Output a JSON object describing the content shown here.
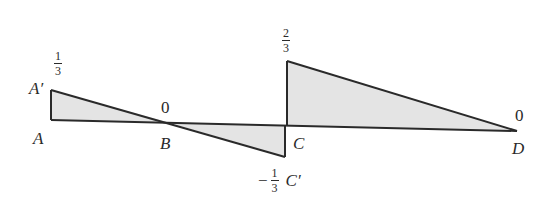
{
  "diagram": {
    "points": {
      "A": {
        "label": "A",
        "x": 51,
        "y": 120
      },
      "A_prime": {
        "label": "A′",
        "x": 51,
        "y": 90
      },
      "B": {
        "label": "B",
        "x": 167,
        "y": 122
      },
      "C": {
        "label": "C",
        "x": 285,
        "y": 126
      },
      "C_prime": {
        "label": "C′",
        "x": 285,
        "y": 157
      },
      "C_top": {
        "x": 287,
        "y": 61
      },
      "D": {
        "label": "D",
        "x": 517,
        "y": 131
      }
    },
    "values": {
      "A_prime": {
        "num": "1",
        "den": "3",
        "sign": ""
      },
      "B": "0",
      "C_top": {
        "num": "2",
        "den": "3",
        "sign": ""
      },
      "C_prime": {
        "num": "1",
        "den": "3",
        "sign": "−"
      },
      "D": "0"
    },
    "colors": {
      "line": "#2a2a2a",
      "fill": "#e4e4e4"
    }
  }
}
